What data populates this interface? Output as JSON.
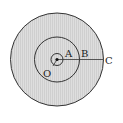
{
  "diagram": {
    "type": "concentric-circles",
    "fill_color": "#d6d6d6",
    "stroke_color": "#333333",
    "labels": {
      "center": "O",
      "point_a": "A",
      "point_b": "B",
      "point_c": "C"
    }
  }
}
